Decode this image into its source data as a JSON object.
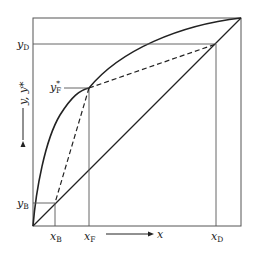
{
  "diagram": {
    "type": "McCabe-Thiele style equilibrium diagram",
    "axes": {
      "x_label": "x",
      "y_label": "y, y*"
    },
    "labels": {
      "yD": {
        "main": "y",
        "sub": "D"
      },
      "yF_star": {
        "main": "y",
        "sup": "*",
        "sub": "F"
      },
      "yB": {
        "main": "y",
        "sub": "B"
      },
      "xB": {
        "main": "x",
        "sub": "B"
      },
      "xF": {
        "main": "x",
        "sub": "F"
      },
      "xD": {
        "main": "x",
        "sub": "D"
      }
    },
    "colors": {
      "line": "#222222",
      "thin": "#555555",
      "background": "#ffffff"
    },
    "elements": [
      "equilibrium-curve",
      "diagonal-line",
      "operating-line-dashed-upper",
      "operating-line-dashed-lower",
      "reference-lines"
    ]
  }
}
